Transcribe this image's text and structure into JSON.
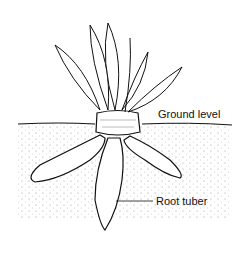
{
  "diagram": {
    "labels": {
      "ground": "Ground level",
      "tuber": "Root tuber"
    },
    "colors": {
      "line": "#111111",
      "background": "#ffffff",
      "soil_dots": "#555555"
    }
  }
}
